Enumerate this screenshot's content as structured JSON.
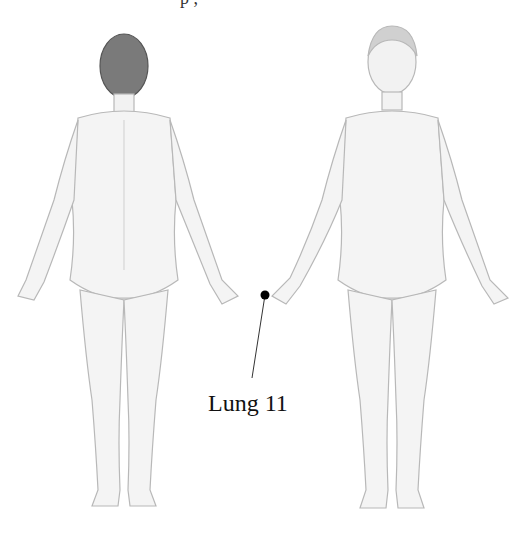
{
  "diagram": {
    "type": "acupuncture-point-illustration",
    "views": [
      {
        "id": "back",
        "label": "posterior view"
      },
      {
        "id": "front",
        "label": "anterior view"
      }
    ],
    "annotation": {
      "point_label": "Lung 11",
      "marker": {
        "x": 265,
        "y": 295,
        "color": "#000000"
      },
      "leader_end": {
        "x": 252,
        "y": 378
      }
    },
    "top_clipped_text": "p ,"
  },
  "colors": {
    "background": "#ffffff",
    "outline": "#b8b8b8",
    "shading": "#e6e6e6",
    "hair_back": "#6a6a6a",
    "text": "#111111"
  }
}
